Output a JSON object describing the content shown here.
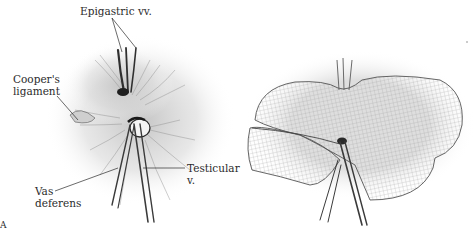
{
  "figure": {
    "panel_letter": "A",
    "left_panel": {
      "labels": {
        "epigastric": "Epigastric vv.",
        "cooper_line1": "Cooper's",
        "cooper_line2": "ligament",
        "testicular_line1": "Testicular",
        "testicular_line2": "v.",
        "vas_line1": "Vas",
        "vas_line2": "deferens"
      }
    },
    "right_panel": {
      "description": "Mesh placed over myopectineal orifice with slit around cord structures"
    },
    "colors": {
      "ink": "#2b2b2b",
      "shade": "#9a9a9a",
      "background": "#ffffff"
    }
  }
}
